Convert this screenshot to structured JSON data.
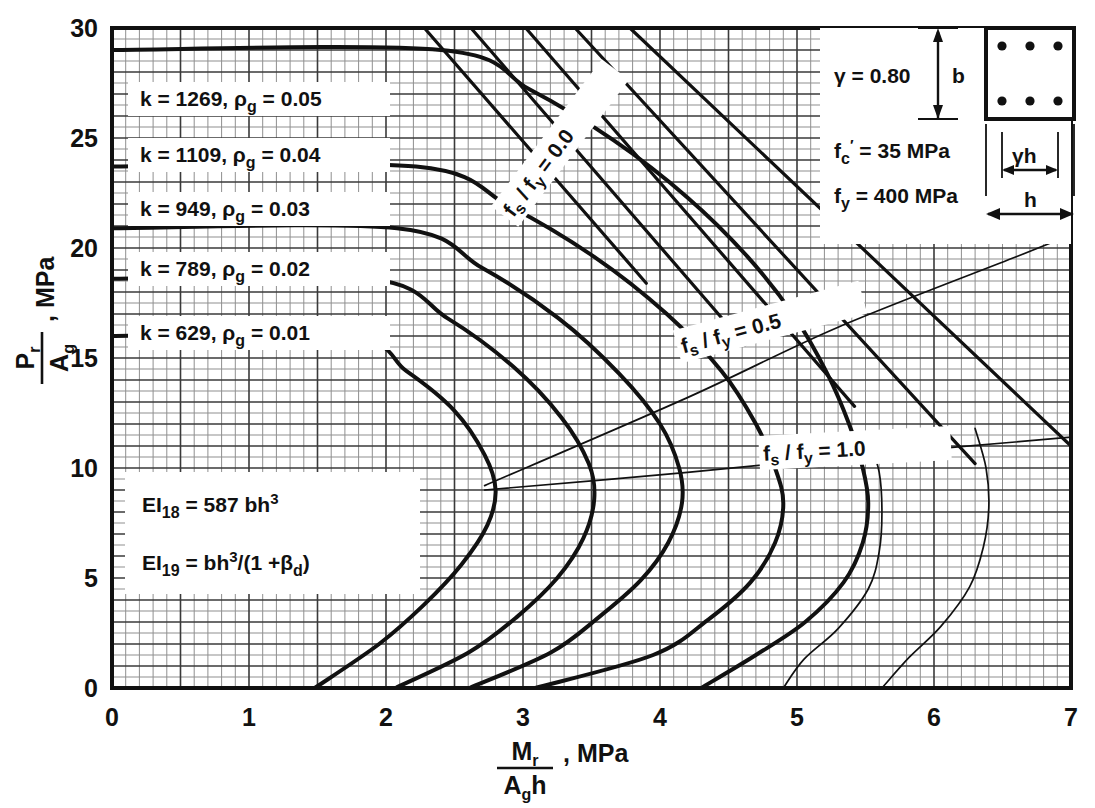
{
  "chart_data": {
    "type": "line",
    "title": "",
    "xlabel": "Mr / (Ag h), MPa",
    "ylabel": "Pr / Ag, MPa",
    "xlim": [
      0,
      7
    ],
    "ylim": [
      0,
      30
    ],
    "xticks": [
      "0",
      "1",
      "2",
      "3",
      "4",
      "5",
      "6",
      "7"
    ],
    "yticks": [
      "0",
      "5",
      "10",
      "15",
      "20",
      "25",
      "30"
    ],
    "grid": true,
    "x_minor_step": 0.1,
    "y_minor_step": 0.5,
    "legend_position": "inline-on-curves",
    "series": [
      {
        "name": "k = 629, rho_g = 0.01",
        "k": 629,
        "rho_g": 0.01,
        "label": "k =  629,",
        "rho_label": "= 0.01",
        "plateau_P": 16.0,
        "points": [
          [
            0,
            16.0
          ],
          [
            1.72,
            16.0
          ],
          [
            2.15,
            14.4
          ],
          [
            2.5,
            12.6
          ],
          [
            2.72,
            10.6
          ],
          [
            2.8,
            9.0
          ],
          [
            2.74,
            7.4
          ],
          [
            2.55,
            5.6
          ],
          [
            2.28,
            3.8
          ],
          [
            1.95,
            2.0
          ],
          [
            1.48,
            0
          ]
        ]
      },
      {
        "name": "k = 789, rho_g = 0.02",
        "k": 789,
        "rho_g": 0.02,
        "label": "k =  789,",
        "rho_label": "= 0.02",
        "plateau_P": 18.6,
        "points": [
          [
            0,
            18.6
          ],
          [
            1.88,
            18.6
          ],
          [
            2.45,
            16.8
          ],
          [
            2.93,
            14.6
          ],
          [
            3.28,
            12.3
          ],
          [
            3.48,
            10.2
          ],
          [
            3.52,
            8.6
          ],
          [
            3.44,
            6.8
          ],
          [
            3.25,
            5.0
          ],
          [
            2.95,
            3.2
          ],
          [
            2.6,
            1.6
          ],
          [
            2.07,
            0
          ]
        ]
      },
      {
        "name": "k = 949, rho_g = 0.03",
        "k": 949,
        "rho_g": 0.03,
        "label": "k =  949,",
        "rho_label": "= 0.03",
        "plateau_P": 20.9,
        "points": [
          [
            0,
            20.9
          ],
          [
            2.08,
            20.9
          ],
          [
            2.7,
            19.1
          ],
          [
            3.26,
            16.8
          ],
          [
            3.7,
            14.3
          ],
          [
            4.0,
            12.0
          ],
          [
            4.14,
            10.0
          ],
          [
            4.16,
            8.4
          ],
          [
            4.06,
            6.6
          ],
          [
            3.86,
            4.9
          ],
          [
            3.55,
            3.2
          ],
          [
            3.2,
            1.6
          ],
          [
            2.61,
            0
          ]
        ]
      },
      {
        "name": "k = 1109, rho_g = 0.04",
        "k": 1109,
        "rho_g": 0.04,
        "label": "k = 1109,",
        "rho_label": "= 0.04",
        "plateau_P": 23.7,
        "points": [
          [
            0,
            23.7
          ],
          [
            2.22,
            23.7
          ],
          [
            2.9,
            21.9
          ],
          [
            3.52,
            19.6
          ],
          [
            4.05,
            17.0
          ],
          [
            4.45,
            14.4
          ],
          [
            4.7,
            12.0
          ],
          [
            4.84,
            10.0
          ],
          [
            4.9,
            8.4
          ],
          [
            4.84,
            6.6
          ],
          [
            4.66,
            4.8
          ],
          [
            4.35,
            3.1
          ],
          [
            3.95,
            1.5
          ],
          [
            3.09,
            0
          ]
        ]
      },
      {
        "name": "k = 1269, rho_g = 0.05",
        "k": 1269,
        "rho_g": 0.05,
        "label": "k = 1269,",
        "rho_label": "= 0.05",
        "plateau_P": 29.0,
        "points": [
          [
            0,
            29.0
          ],
          [
            2.4,
            29.0
          ],
          [
            3.05,
            27.2
          ],
          [
            3.66,
            24.9
          ],
          [
            4.2,
            22.3
          ],
          [
            4.64,
            19.6
          ],
          [
            4.98,
            16.9
          ],
          [
            5.22,
            14.3
          ],
          [
            5.38,
            12.0
          ],
          [
            5.48,
            10.0
          ],
          [
            5.52,
            8.4
          ],
          [
            5.48,
            6.6
          ],
          [
            5.34,
            4.8
          ],
          [
            5.06,
            3.0
          ],
          [
            4.7,
            1.5
          ],
          [
            4.3,
            0
          ]
        ]
      }
    ],
    "thin_curves": [
      {
        "name": "rho_g = 0.04 extension",
        "points": [
          [
            5.52,
            11.4
          ],
          [
            5.6,
            9.8
          ],
          [
            5.62,
            8.0
          ],
          [
            5.6,
            6.2
          ],
          [
            5.52,
            4.5
          ],
          [
            5.3,
            2.7
          ],
          [
            5.05,
            1.3
          ],
          [
            4.9,
            0
          ]
        ]
      },
      {
        "name": "rho_g = 0.05 extension",
        "points": [
          [
            6.3,
            11.8
          ],
          [
            6.38,
            10.0
          ],
          [
            6.4,
            8.2
          ],
          [
            6.36,
            6.4
          ],
          [
            6.26,
            4.6
          ],
          [
            6.05,
            2.8
          ],
          [
            5.82,
            1.4
          ],
          [
            5.62,
            0
          ]
        ]
      }
    ],
    "ratio_lines": [
      {
        "name": "fs/fy = 0.0",
        "label": "f s / f y = 0.0",
        "value": 0.0,
        "family": [
          [
            [
              3.02,
              30.0
            ],
            [
              5.42,
              12.8
            ]
          ],
          [
            [
              3.38,
              30.0
            ],
            [
              6.3,
              10.2
            ]
          ],
          [
            [
              3.78,
              30.0
            ],
            [
              7.0,
              11.0
            ]
          ],
          [
            [
              2.62,
              30.0
            ],
            [
              4.62,
              15.6
            ]
          ],
          [
            [
              2.28,
              30.0
            ],
            [
              3.9,
              18.4
            ]
          ]
        ]
      },
      {
        "name": "fs/fy = 0.5",
        "label": "f s / f y = 0.5",
        "value": 0.5,
        "points": [
          [
            2.72,
            9.2
          ],
          [
            4.2,
            13.2
          ],
          [
            5.3,
            16.4
          ],
          [
            6.6,
            19.6
          ],
          [
            7.0,
            20.6
          ]
        ]
      },
      {
        "name": "fs/fy = 1.0",
        "label": "f s / f y = 1.0",
        "value": 1.0,
        "points": [
          [
            2.72,
            9.0
          ],
          [
            4.2,
            9.8
          ],
          [
            5.52,
            10.6
          ],
          [
            7.0,
            11.4
          ]
        ]
      }
    ]
  },
  "yaxis": {
    "numerator": "P",
    "numerator_sub": "r",
    "denominator": "A",
    "denominator_sub": "g",
    "unit": ", MPa"
  },
  "xaxis": {
    "numerator": "M",
    "numerator_sub": "r",
    "denominator": "A",
    "denominator_sub": "g",
    "denominator_tail": "h",
    "unit": ", MPa"
  },
  "curve_labels": [
    {
      "k_text": "k = 1269,",
      "rho_symbol": "ρ",
      "rho_sub": "g",
      "eq_text": "= 0.05"
    },
    {
      "k_text": "k = 1109,",
      "rho_symbol": "ρ",
      "rho_sub": "g",
      "eq_text": "= 0.04"
    },
    {
      "k_text": "k =  949,",
      "rho_symbol": "ρ",
      "rho_sub": "g",
      "eq_text": "= 0.03"
    },
    {
      "k_text": "k =  789,",
      "rho_symbol": "ρ",
      "rho_sub": "g",
      "eq_text": "= 0.02"
    },
    {
      "k_text": "k =  629,",
      "rho_symbol": "ρ",
      "rho_sub": "g",
      "eq_text": "= 0.01"
    }
  ],
  "ei_box": {
    "line1_prefix": "EI",
    "line1_sub": "18",
    "line1_rest": "=  587 bh",
    "line1_sup": "3",
    "line2_prefix": "EI",
    "line2_sub": "19",
    "line2_rest": "=  bh",
    "line2_sup": "3",
    "line2_tail": "/(1 +",
    "line2_beta": "β",
    "line2_beta_sub": "d",
    "line2_close": ")"
  },
  "info_box": {
    "gamma_symbol": "γ",
    "gamma_value": "=  0.80",
    "fc_symbol": "f",
    "fc_sub": "c",
    "fc_prime": "′",
    "fc_value": "=   35  MPa",
    "fy_symbol": "f",
    "fy_sub": "y",
    "fy_value": "=  400  MPa",
    "dim_b": "b",
    "dim_gh_gamma": "γ",
    "dim_gh_h": "h",
    "dim_h": "h",
    "bar_count": 6
  },
  "fs_labels": {
    "zero": {
      "f1": "f",
      "s1": "s",
      "slash": "/ ",
      "f2": "f",
      "s2": "y",
      "eq": "= 0.0"
    },
    "half": {
      "f1": "f",
      "s1": "s",
      "slash": "/ ",
      "f2": "f",
      "s2": "y",
      "eq": "= 0.5"
    },
    "one": {
      "f1": "f",
      "s1": "s",
      "slash": "/ ",
      "f2": "f",
      "s2": "y",
      "eq": "= 1.0"
    }
  },
  "colors": {
    "ink": "#111111",
    "grid_major": "#3a3a3a",
    "grid_minor": "#8a8a8a",
    "background": "#ffffff"
  }
}
